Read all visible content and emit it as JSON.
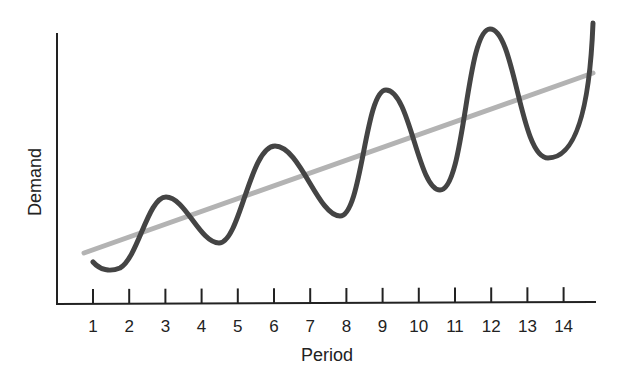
{
  "chart_data": {
    "type": "line",
    "title": "",
    "xlabel": "Period",
    "ylabel": "Demand",
    "categories": [
      "1",
      "2",
      "3",
      "4",
      "5",
      "6",
      "7",
      "8",
      "9",
      "10",
      "11",
      "12",
      "13",
      "14"
    ],
    "x": [
      1,
      2,
      3,
      4,
      5,
      6,
      7,
      8,
      9,
      10,
      11,
      12,
      13,
      14
    ],
    "series": [
      {
        "name": "Demand (seasonal)",
        "color": "#444444",
        "values": [
          1.3,
          1.1,
          3.8,
          2.5,
          4.4,
          5.9,
          4.3,
          3.6,
          7.6,
          5.2,
          4.4,
          10.0,
          6.6,
          5.0
        ]
      },
      {
        "name": "Trend",
        "color": "#b3b3b3",
        "values": [
          1.6,
          2.3,
          3.0,
          3.6,
          4.3,
          5.0,
          5.6,
          6.3,
          7.0,
          7.6,
          8.3,
          9.0,
          9.6,
          10.3
        ]
      }
    ],
    "xlim": [
      0,
      15
    ],
    "ylim": [
      0,
      11
    ],
    "grid": false,
    "legend": "none",
    "yticks": "none",
    "annotations": []
  }
}
